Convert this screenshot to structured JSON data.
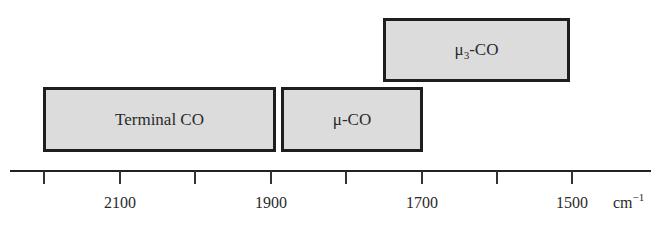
{
  "diagram": {
    "title": "",
    "axis": {
      "unit_base": "cm",
      "unit_exponent": "−1",
      "ticks": [
        {
          "value": 2200,
          "label": ""
        },
        {
          "value": 2100,
          "label": "2100"
        },
        {
          "value": 2000,
          "label": ""
        },
        {
          "value": 1900,
          "label": "1900"
        },
        {
          "value": 1800,
          "label": ""
        },
        {
          "value": 1700,
          "label": "1700"
        },
        {
          "value": 1600,
          "label": ""
        },
        {
          "value": 1500,
          "label": "1500"
        }
      ],
      "direction": "decreasing-left-to-right"
    },
    "bands": [
      {
        "id": "terminal",
        "label": "Terminal CO",
        "label_base": "Terminal CO",
        "label_sub": "",
        "label_suffix": "",
        "range_cm1": [
          2190,
          1885
        ],
        "row": "lower"
      },
      {
        "id": "mu",
        "label": "μ-CO",
        "label_base": "μ-CO",
        "label_sub": "",
        "label_suffix": "",
        "range_cm1": [
          1880,
          1695
        ],
        "row": "lower"
      },
      {
        "id": "mu3",
        "label": "μ3-CO",
        "label_base": "μ",
        "label_sub": "3",
        "label_suffix": "-CO",
        "range_cm1": [
          1750,
          1500
        ],
        "row": "upper"
      }
    ],
    "colors": {
      "band_fill": "#dcdcdc",
      "band_border": "#1e1e1e",
      "axis": "#222222",
      "text": "#2a2a2a"
    }
  }
}
